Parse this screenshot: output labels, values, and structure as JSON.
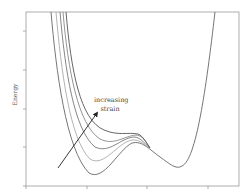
{
  "chart_data": {
    "type": "line",
    "title": "",
    "xlabel": "",
    "ylabel": "Energy",
    "grid": false,
    "legend": null,
    "annotations": [
      {
        "text_line1": "increasing",
        "text_line2": "strain",
        "arrow": {
          "from": [
            58,
            168
          ],
          "to": [
            97,
            113
          ]
        }
      }
    ],
    "x_ticks_px": [
      26,
      87,
      147,
      208
    ],
    "y_ticks_px": [
      31,
      70,
      109,
      147,
      186
    ],
    "series": [
      {
        "name": "strain level 1",
        "color": "#666666",
        "path": "M51,12 C56,70 66,150 89,173 C104,182 118,150 132,143 C142,140 150,150 160,157 C170,164 176,170 182,166 C196,160 206,90 215,12"
      },
      {
        "name": "strain level 2",
        "color": "#aaaaaa",
        "path": "M56,12 C61,70 70,140 90,159 C104,168 118,142 132,140 C140,139 146,146 150,149"
      },
      {
        "name": "strain level 3",
        "color": "#777777",
        "path": "M60,12 C65,70 74,130 95,147 C110,154 120,138 134,137 C140,137 144,143 150,148"
      },
      {
        "name": "strain level 4",
        "color": "#888888",
        "path": "M63,12 C68,70 78,125 100,139 C114,146 124,136 136,135 C142,135 146,142 150,148"
      },
      {
        "name": "strain level 5",
        "color": "#555555",
        "path": "M66,12 C71,70 80,120 104,130 C118,136 128,132 138,134 C143,136 146,142 150,148"
      }
    ]
  },
  "labels": {
    "ylabel": "Energy",
    "annotation_line1": "increasing",
    "annotation_line2": "strain"
  }
}
